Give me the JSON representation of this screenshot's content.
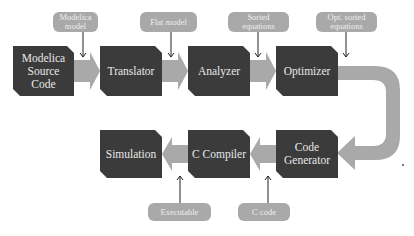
{
  "diagram": {
    "type": "flowchart",
    "top_row": {
      "boxes": [
        {
          "id": "source",
          "label": "Modelica Source Code",
          "lines": [
            "Modelica",
            "Source",
            "Code"
          ]
        },
        {
          "id": "translator",
          "label": "Translator"
        },
        {
          "id": "analyzer",
          "label": "Analyzer"
        },
        {
          "id": "optimizer",
          "label": "Optimizer"
        }
      ],
      "annotations": [
        {
          "lines": [
            "Modelica",
            "model"
          ],
          "points_to": "source->translator"
        },
        {
          "lines": [
            "Flat model"
          ],
          "points_to": "translator->analyzer"
        },
        {
          "lines": [
            "Sorted",
            "equations"
          ],
          "points_to": "analyzer->optimizer"
        },
        {
          "lines": [
            "Opt. sorted",
            "equations"
          ],
          "points_to": "optimizer->code_generator"
        }
      ]
    },
    "bottom_row": {
      "boxes": [
        {
          "id": "simulation",
          "label": "Simulation"
        },
        {
          "id": "c_compiler",
          "label": "C Compiler"
        },
        {
          "id": "code_generator",
          "label": "Code Generator",
          "lines": [
            "Code",
            "Generator"
          ]
        }
      ],
      "annotations": [
        {
          "lines": [
            "Executable"
          ],
          "points_to": "c_compiler->simulation"
        },
        {
          "lines": [
            "C code"
          ],
          "points_to": "code_generator->c_compiler"
        }
      ]
    },
    "colors": {
      "box": "#3b3b3b",
      "box_text": "#e8e8e8",
      "arrow": "#a9a9a9",
      "pill": "#a9a9a9",
      "pointer": "#222222"
    }
  }
}
